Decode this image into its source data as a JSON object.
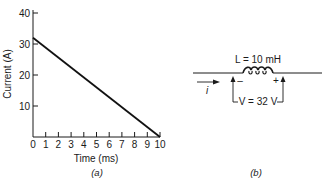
{
  "chart_data": {
    "type": "line",
    "title": "",
    "xlabel": "Time (ms)",
    "ylabel": "Current (A)",
    "xlim": [
      0,
      10
    ],
    "ylim": [
      0,
      40
    ],
    "x_ticks": [
      "0",
      "1",
      "2",
      "3",
      "4",
      "5",
      "6",
      "7",
      "8",
      "9",
      "10"
    ],
    "y_ticks": [
      "10",
      "20",
      "30",
      "40"
    ],
    "grid": false,
    "series": [
      {
        "name": "i(t)",
        "x": [
          0,
          10
        ],
        "values": [
          32,
          0
        ]
      }
    ],
    "caption": "(a)"
  },
  "circuit": {
    "inductor_label": "L = 10 mH",
    "current_label": "i",
    "voltage_label": "V = 32 V",
    "minus_sign": "–",
    "plus_sign": "+",
    "caption": "(b)"
  }
}
